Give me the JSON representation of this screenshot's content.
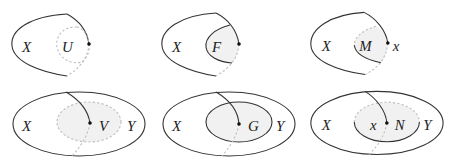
{
  "diagram": {
    "layout": {
      "rows": 2,
      "columns": 3
    },
    "colors": {
      "stroke": "#333333",
      "dashed_stroke": "#bdbdbd",
      "shade": "#f1f1f1",
      "dot": "#111111",
      "text": "#222222"
    },
    "panels": [
      {
        "id": "top-1",
        "outer_label": "X",
        "inner_label": "U",
        "point_label": "",
        "inner_boundary": "dashed",
        "inner_shaded": false
      },
      {
        "id": "top-2",
        "outer_label": "X",
        "inner_label": "F",
        "point_label": "",
        "inner_boundary": "solid-left-dashed-right",
        "inner_shaded": true
      },
      {
        "id": "top-3",
        "outer_label": "X",
        "inner_label": "M",
        "point_label": "x",
        "inner_boundary": "solid-left-dashed-right",
        "inner_shaded": true
      },
      {
        "id": "bottom-1",
        "outer_label": "X",
        "inner_label": "V",
        "region_label": "Y",
        "point_label": "",
        "inner_boundary": "dashed",
        "inner_shaded": true
      },
      {
        "id": "bottom-2",
        "outer_label": "X",
        "inner_label": "G",
        "region_label": "Y",
        "point_label": "",
        "inner_boundary": "solid",
        "inner_shaded": true
      },
      {
        "id": "bottom-3",
        "outer_label": "X",
        "inner_label": "N",
        "region_label": "Y",
        "point_label": "x",
        "inner_boundary": "dashed-top-solid-bottom",
        "inner_shaded": true
      }
    ]
  }
}
